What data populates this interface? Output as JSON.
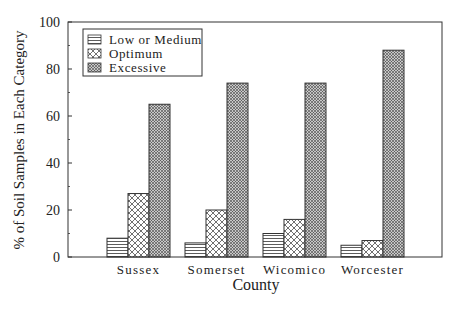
{
  "chart_data": {
    "type": "bar",
    "title": "",
    "xlabel": "County",
    "ylabel": "% of Soil Samples in Each Category",
    "categories": [
      "Sussex",
      "Somerset",
      "Wicomico",
      "Worcester"
    ],
    "series": [
      {
        "name": "Low or Medium",
        "pattern": "horizontal-lines",
        "values": [
          8,
          6,
          10,
          5
        ]
      },
      {
        "name": "Optimum",
        "pattern": "crosshatch",
        "values": [
          27,
          20,
          16,
          7
        ]
      },
      {
        "name": "Excessive",
        "pattern": "dense-crosshatch",
        "values": [
          65,
          74,
          74,
          88
        ]
      }
    ],
    "ylim": [
      0,
      100
    ],
    "yticks": [
      0,
      20,
      40,
      60,
      80,
      100
    ],
    "grid": false,
    "legend_position": "top-left inside"
  },
  "legend": {
    "items": [
      {
        "label": "Low or Medium"
      },
      {
        "label": "Optimum"
      },
      {
        "label": "Excessive"
      }
    ]
  }
}
